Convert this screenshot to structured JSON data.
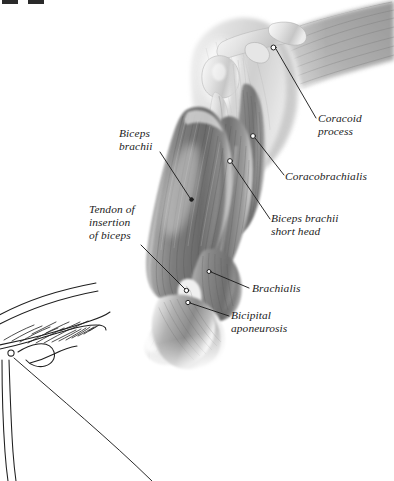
{
  "figure": {
    "style": "grayscale anatomical airbrush illustration with leader-line labels",
    "background_color": "#ffffff",
    "ink_color": "#1b1b1b"
  },
  "labels": [
    {
      "id": "coracoid-process",
      "lines": [
        "Coracoid",
        "process"
      ],
      "line1": "Coracoid",
      "line2": "process",
      "side": "right",
      "x": 318,
      "y": 118
    },
    {
      "id": "coracobrachialis",
      "lines": [
        "Coracobrachialis"
      ],
      "line1": "Coracobrachialis",
      "side": "right",
      "x": 284,
      "y": 176
    },
    {
      "id": "biceps-brachii-short-head",
      "lines": [
        "Biceps brachii",
        "short head"
      ],
      "line1": "Biceps brachii",
      "line2": "short head",
      "side": "right",
      "x": 270,
      "y": 210
    },
    {
      "id": "brachialis",
      "lines": [
        "Brachialis"
      ],
      "line1": "Brachialis",
      "side": "right",
      "x": 250,
      "y": 282
    },
    {
      "id": "bicipital-aponeurosis",
      "lines": [
        "Bicipital",
        "aponeurosis"
      ],
      "line1": "Bicipital",
      "line2": "aponeurosis",
      "side": "right",
      "x": 230,
      "y": 306
    },
    {
      "id": "biceps-brachii",
      "lines": [
        "Biceps",
        "brachii"
      ],
      "line1": "Biceps",
      "line2": "brachii",
      "side": "left",
      "x": 118,
      "y": 126
    },
    {
      "id": "tendon-of-insertion-of-biceps",
      "lines": [
        "Tendon of",
        "insertion",
        "of biceps"
      ],
      "line1": "Tendon of",
      "line2": "insertion",
      "line3": "of biceps",
      "side": "left",
      "x": 88,
      "y": 203
    }
  ],
  "inset": {
    "id": "shoulder-girdle-line-drawing",
    "description": "uncolored line-art outline of clavicle and scapula with hatching, lower-left corner"
  },
  "edge_marks": {
    "description": "two small dark page-edge artifacts at top-left",
    "count": 2
  }
}
